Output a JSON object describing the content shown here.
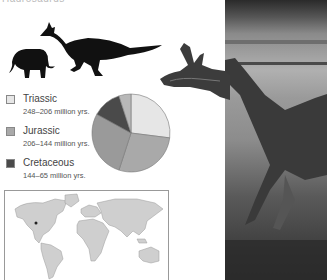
{
  "header": {
    "cutoff_text": "Hadrosaurus"
  },
  "legend": {
    "items": [
      {
        "name": "Triassic",
        "range": "248–206 million yrs.",
        "color": "#e6e6e6"
      },
      {
        "name": "Jurassic",
        "range": "206–144 million yrs.",
        "color": "#a9a9a9"
      },
      {
        "name": "Cretaceous",
        "range": "144–65 million yrs.",
        "color": "#4a4a4a"
      }
    ]
  },
  "chart_data": {
    "type": "pie",
    "title": "",
    "slices": [
      {
        "label": "Triassic",
        "value": 27,
        "color": "#e6e6e6"
      },
      {
        "label": "Jurassic",
        "value": 28,
        "color": "#a9a9a9"
      },
      {
        "label": "Jurassic (part 2)",
        "value": 28,
        "color": "#9a9a9a"
      },
      {
        "label": "Cretaceous",
        "value": 12,
        "color": "#4a4a4a"
      },
      {
        "label": "Other",
        "value": 5,
        "color": "#b8b8b8"
      }
    ]
  },
  "map": {
    "label": "world-map-locator"
  }
}
